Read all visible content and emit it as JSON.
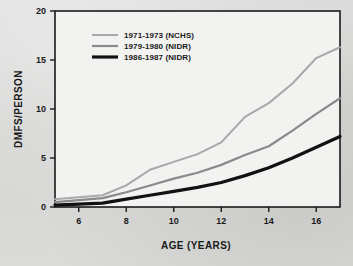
{
  "figure": {
    "background_color": "#d8d8d6",
    "plot_background_color": "#f2f2f0",
    "frame_color": "#1a1a1a"
  },
  "chart_data": {
    "type": "line",
    "title": "",
    "xlabel": "AGE (YEARS)",
    "ylabel": "DMFS/PERSON",
    "xlim": [
      5,
      17
    ],
    "ylim": [
      0,
      20
    ],
    "xticks": [
      6,
      8,
      10,
      12,
      14,
      16
    ],
    "yticks": [
      0,
      5,
      10,
      15,
      20
    ],
    "xtick_labels": [
      "6",
      "8",
      "10",
      "12",
      "14",
      "16"
    ],
    "ytick_labels": [
      "0",
      "5",
      "10",
      "15",
      "20"
    ],
    "grid": false,
    "legend_position": "upper-left-inside",
    "x": [
      5,
      6,
      7,
      8,
      9,
      10,
      11,
      12,
      13,
      14,
      15,
      16,
      17
    ],
    "series": [
      {
        "name": "1971-1973 (NCHS)",
        "color": "#a8a8a8",
        "line_width": 2.0,
        "line_style": "solid-light",
        "values": [
          0.8,
          1.0,
          1.2,
          2.2,
          3.8,
          4.6,
          5.4,
          6.6,
          9.2,
          10.6,
          12.6,
          15.2,
          16.3
        ]
      },
      {
        "name": "1979-1980 (NIDR)",
        "color": "#8a8a8a",
        "line_width": 2.2,
        "line_style": "solid-medium",
        "values": [
          0.5,
          0.7,
          0.9,
          1.5,
          2.2,
          2.9,
          3.5,
          4.3,
          5.3,
          6.2,
          7.8,
          9.5,
          11.1
        ]
      },
      {
        "name": "1986-1987 (NIDR)",
        "color": "#111111",
        "line_width": 3.2,
        "line_style": "solid-thick",
        "values": [
          0.2,
          0.3,
          0.4,
          0.8,
          1.2,
          1.6,
          2.0,
          2.5,
          3.2,
          4.0,
          5.0,
          6.1,
          7.2
        ]
      }
    ]
  },
  "legend": {
    "entries": [
      {
        "label": "1971-1973 (NCHS)",
        "swatch": "light-gray-line-swatch"
      },
      {
        "label": "1979-1980 (NIDR)",
        "swatch": "medium-gray-line-swatch"
      },
      {
        "label": "1986-1987 (NIDR)",
        "swatch": "black-line-swatch"
      }
    ]
  }
}
